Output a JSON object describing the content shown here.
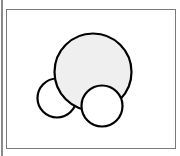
{
  "diagram": {
    "frame": {
      "border_color": "#7a7a7a",
      "background": "#ffffff"
    },
    "stroke_color": "#000000",
    "stroke_width": 2.2,
    "circles": [
      {
        "name": "small-left-circle",
        "cx": 57,
        "cy": 98,
        "r": 19.5,
        "fill": "#ffffff"
      },
      {
        "name": "large-circle",
        "cx": 93,
        "cy": 72,
        "r": 38.5,
        "fill": "#efefef"
      },
      {
        "name": "bottom-right-circle",
        "cx": 102,
        "cy": 106,
        "r": 20.5,
        "fill": "#ffffff"
      }
    ]
  }
}
